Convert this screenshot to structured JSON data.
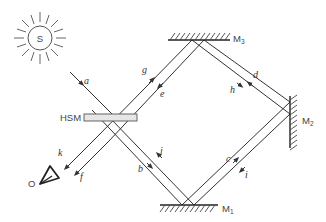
{
  "diagram": {
    "type": "ring-interferometer",
    "source": {
      "label": "S"
    },
    "observer": {
      "label": "O"
    },
    "beam_splitter": {
      "label": "HSM"
    },
    "mirrors": [
      {
        "id": "M1",
        "label": "M",
        "subscript": "1"
      },
      {
        "id": "M2",
        "label": "M",
        "subscript": "2"
      },
      {
        "id": "M3",
        "label": "M",
        "subscript": "3"
      }
    ],
    "beams": {
      "a": "a",
      "b": "b",
      "c": "c",
      "d": "d",
      "e": "e",
      "f": "f",
      "g": "g",
      "h": "h",
      "i": "i",
      "j": "j",
      "k": "k"
    },
    "colors": {
      "line": "#333333",
      "hsm_fill": "#e6e6e6",
      "background": "#ffffff"
    }
  }
}
